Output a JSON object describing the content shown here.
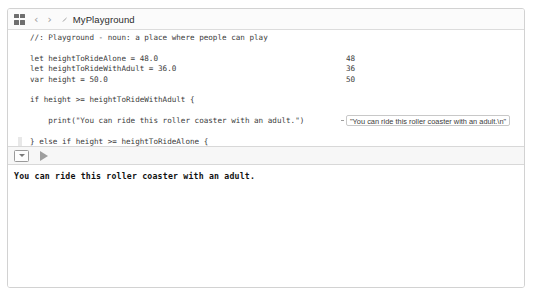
{
  "toolbar": {
    "panel_icon": "grid-icon",
    "back_label": "‹",
    "forward_label": "›",
    "file_icon": "swift-file-icon",
    "title": "MyPlayground"
  },
  "editor": {
    "lines": [
      {
        "text": "//: Playground - noun: a place where people can play",
        "gutter": false
      },
      {
        "text": "",
        "gutter": false
      },
      {
        "text": "let heightToRideAlone = 48.0",
        "gutter": false
      },
      {
        "text": "let heightToRideWithAdult = 36.0",
        "gutter": false
      },
      {
        "text": "var height = 50.0",
        "gutter": false
      },
      {
        "text": "",
        "gutter": false
      },
      {
        "text": "if height >= heightToRideWithAdult {",
        "gutter": false
      },
      {
        "text": "",
        "gutter": false
      },
      {
        "text": "    print(\"You can ride this roller coaster with an adult.\")",
        "gutter": false
      },
      {
        "text": "",
        "gutter": false
      },
      {
        "text": "} else if height >= heightToRideAlone {",
        "gutter": true
      },
      {
        "text": "",
        "gutter": false
      },
      {
        "text": "    // This will NEVER get printed out",
        "gutter": false
      },
      {
        "text": "    print(\"You are tall enough to ride this roller coaster",
        "gutter": false
      },
      {
        "text": "        alone.\")",
        "gutter": false
      },
      {
        "text": "",
        "gutter": false
      },
      {
        "text": "} else {",
        "gutter": true
      },
      {
        "text": "",
        "gutter": false
      },
      {
        "text": "    print(\"Sorry. You cannot ride this roller coaster.\")",
        "gutter": false,
        "caret": true
      },
      {
        "text": "}",
        "gutter": false
      }
    ]
  },
  "results": {
    "values": [
      {
        "line": 2,
        "text": "48"
      },
      {
        "line": 3,
        "text": "36"
      },
      {
        "line": 4,
        "text": "50"
      }
    ],
    "bubble": {
      "line": 8,
      "text": "\"You can ride this roller coaster with an adult.\\n\""
    }
  },
  "bottom_toolbar": {
    "console_toggle_icon": "console-toggle-icon",
    "run_icon": "play-icon"
  },
  "console": {
    "output": "You can ride this roller coaster with an adult."
  },
  "colors": {
    "frame_border": "#d2d2d2",
    "toolbar_bg": "#fbfbfb",
    "editor_bg": "#ffffff",
    "code_text": "#3b3b3b",
    "console_text": "#111111",
    "bubble_border": "#c8c8c8",
    "gutter_bar": "#e8e8e8"
  }
}
